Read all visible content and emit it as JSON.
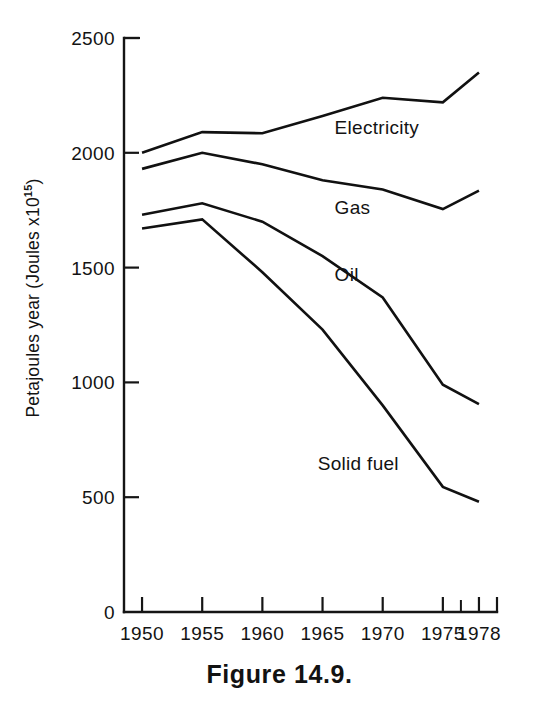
{
  "figure": {
    "caption": "Figure 14.9.",
    "y_axis_label_main": "Petajoules year (Joules x10",
    "y_axis_label_sup": "15",
    "y_axis_label_tail": ")"
  },
  "chart_data": {
    "type": "line",
    "title": "",
    "xlabel": "",
    "ylabel": "Petajoules year (Joules x10^15)",
    "x": [
      1950,
      1955,
      1960,
      1965,
      1970,
      1975,
      1978
    ],
    "categories": [
      "1950",
      "1955",
      "1960",
      "1965",
      "1970",
      "1975",
      "1978"
    ],
    "xlim": [
      1948.5,
      1979.5
    ],
    "ylim": [
      0,
      2500
    ],
    "yticks": [
      0,
      500,
      1000,
      1500,
      2000,
      2500
    ],
    "ytick_labels": [
      "0",
      "500",
      "1000",
      "1500",
      "2000",
      "2500"
    ],
    "xticks": [
      1950,
      1955,
      1960,
      1965,
      1970,
      1975,
      1978
    ],
    "xtick_labels": [
      "1950",
      "1955",
      "1960",
      "1965",
      "1970",
      "1975",
      "1978"
    ],
    "x_minor_ticks": [
      1976.5
    ],
    "grid": false,
    "legend": "inline-labels",
    "series": [
      {
        "name": "Electricity",
        "label": "Electricity",
        "color": "#111111",
        "label_x": 1966.0,
        "label_y": 2080,
        "values": [
          2000,
          2090,
          2085,
          2160,
          2240,
          2220,
          2350
        ]
      },
      {
        "name": "Gas",
        "label": "Gas",
        "color": "#111111",
        "label_x": 1966.0,
        "label_y": 1735,
        "values": [
          1930,
          2000,
          1950,
          1880,
          1840,
          1755,
          1835
        ]
      },
      {
        "name": "Oil",
        "label": "Oil",
        "color": "#111111",
        "label_x": 1966.0,
        "label_y": 1440,
        "values": [
          1730,
          1780,
          1700,
          1550,
          1370,
          990,
          905
        ]
      },
      {
        "name": "Solid fuel",
        "label": "Solid fuel",
        "color": "#111111",
        "label_x": 1964.6,
        "label_y": 620,
        "values": [
          1670,
          1710,
          1480,
          1230,
          900,
          545,
          480
        ]
      }
    ]
  }
}
